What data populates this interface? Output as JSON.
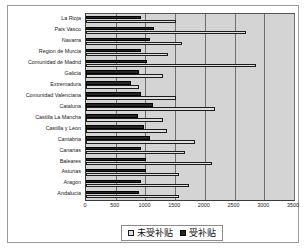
{
  "chart_data": {
    "type": "bar",
    "orientation": "horizontal",
    "title": "",
    "xlabel": "",
    "ylabel": "",
    "xlim": [
      0,
      3500
    ],
    "xticks": [
      "0",
      "500",
      "1000",
      "1500",
      "2000",
      "2500",
      "3000",
      "3500"
    ],
    "grid": true,
    "legend_position": "bottom",
    "categories": [
      "La Rioja",
      "Pais Vasco",
      "Navarra",
      "Region de Murcia",
      "Comunidad de Madrid",
      "Galicia",
      "Extremadura",
      "Comunidad Valenciana",
      "Cataluna",
      "Castilla La Mancha",
      "Castilla y Leon",
      "Cantabria",
      "Canarias",
      "Baleares",
      "Asturias",
      "Aragon",
      "Andalucia"
    ],
    "series": [
      {
        "name": "未受补贴",
        "color": "#dedede",
        "values": [
          1520,
          2700,
          1620,
          1380,
          2860,
          1300,
          890,
          1520,
          2170,
          1300,
          1360,
          1830,
          1660,
          2120,
          1560,
          1730,
          1570
        ]
      },
      {
        "name": "受补贴",
        "color": "#262626",
        "values": [
          930,
          1150,
          1080,
          930,
          1020,
          900,
          760,
          930,
          1120,
          880,
          970,
          1070,
          930,
          1010,
          1010,
          930,
          890
        ]
      }
    ]
  },
  "legend": {
    "items": [
      {
        "label": "未受补贴",
        "swatch": "light"
      },
      {
        "label": "受补贴",
        "swatch": "dark"
      }
    ]
  },
  "colors": {
    "plot_background": "#d4d4d4",
    "frame_border": "#9a9a9a",
    "gridline": "#6e6e6e",
    "series_unsubsidized": "#dedede",
    "series_subsidized": "#262626",
    "text": "#1a1a1a"
  }
}
